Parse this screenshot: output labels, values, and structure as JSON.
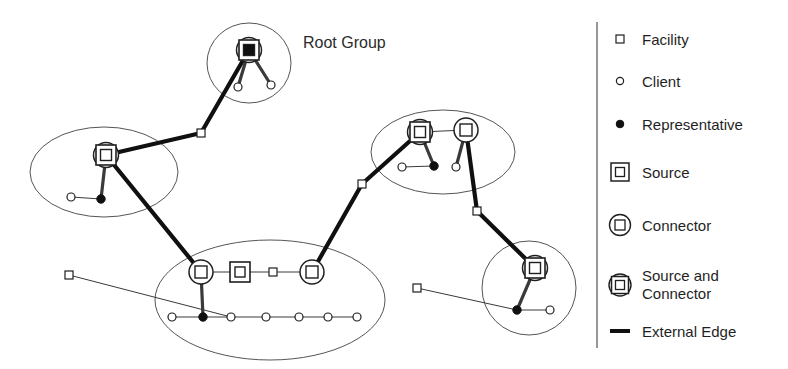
{
  "canvas": {
    "width": 788,
    "height": 369,
    "background": "#ffffff"
  },
  "colors": {
    "ink": "#1f1f1f",
    "group_outline": "#555555",
    "internal_edge": "#3a3a3a",
    "external_edge": "#101010",
    "node_fill": "#ffffff",
    "representative_fill": "#101010",
    "divider": "#6b6b6b"
  },
  "diagram": {
    "annotations": [
      {
        "id": "root-group-label",
        "text": "Root Group",
        "x": 303,
        "y": 48
      }
    ],
    "groups": [
      {
        "id": "group-root",
        "shape": "ellipse",
        "cx": 249,
        "cy": 63,
        "rx": 42,
        "ry": 40
      },
      {
        "id": "group-left",
        "shape": "ellipse",
        "cx": 104,
        "cy": 172,
        "rx": 74,
        "ry": 45
      },
      {
        "id": "group-right",
        "shape": "ellipse",
        "cx": 443,
        "cy": 152,
        "rx": 72,
        "ry": 42
      },
      {
        "id": "group-bottom",
        "shape": "ellipse",
        "cx": 270,
        "cy": 300,
        "rx": 115,
        "ry": 60
      },
      {
        "id": "group-bottom-right",
        "shape": "ellipse",
        "cx": 529,
        "cy": 288,
        "rx": 47,
        "ry": 47
      }
    ],
    "nodes": [
      {
        "id": "n-root-sc",
        "type": "source-and-connector",
        "x": 249,
        "y": 50,
        "group": "group-root"
      },
      {
        "id": "n-root-c1",
        "type": "client",
        "x": 238,
        "y": 87,
        "group": "group-root"
      },
      {
        "id": "n-root-c2",
        "type": "client",
        "x": 271,
        "y": 85,
        "group": "group-root"
      },
      {
        "id": "n-left-sc",
        "type": "source-and-connector",
        "x": 106,
        "y": 155,
        "group": "group-left"
      },
      {
        "id": "n-left-rep",
        "type": "representative",
        "x": 101,
        "y": 199,
        "group": "group-left"
      },
      {
        "id": "n-left-c1",
        "type": "client",
        "x": 71,
        "y": 197,
        "group": "group-left"
      },
      {
        "id": "n-right-sc",
        "type": "source-and-connector",
        "x": 420,
        "y": 132,
        "group": "group-right"
      },
      {
        "id": "n-right-co",
        "type": "connector",
        "x": 466,
        "y": 130,
        "group": "group-right"
      },
      {
        "id": "n-right-rep",
        "type": "representative",
        "x": 434,
        "y": 166,
        "group": "group-right"
      },
      {
        "id": "n-right-c1",
        "type": "client",
        "x": 402,
        "y": 167,
        "group": "group-right"
      },
      {
        "id": "n-right-c2",
        "type": "client",
        "x": 456,
        "y": 167,
        "group": "group-right"
      },
      {
        "id": "n-bot-co1",
        "type": "connector",
        "x": 201,
        "y": 272,
        "group": "group-bottom"
      },
      {
        "id": "n-bot-src",
        "type": "source",
        "x": 240,
        "y": 272,
        "group": "group-bottom"
      },
      {
        "id": "n-bot-fac",
        "type": "facility",
        "x": 273,
        "y": 272,
        "group": "group-bottom"
      },
      {
        "id": "n-bot-co2",
        "type": "connector",
        "x": 312,
        "y": 272,
        "group": "group-bottom"
      },
      {
        "id": "n-bot-rep",
        "type": "representative",
        "x": 203,
        "y": 317,
        "group": "group-bottom"
      },
      {
        "id": "n-bot-c1",
        "type": "client",
        "x": 172,
        "y": 317,
        "group": "group-bottom"
      },
      {
        "id": "n-bot-c2",
        "type": "client",
        "x": 231,
        "y": 317,
        "group": "group-bottom"
      },
      {
        "id": "n-bot-c3",
        "type": "client",
        "x": 266,
        "y": 317,
        "group": "group-bottom"
      },
      {
        "id": "n-bot-c4",
        "type": "client",
        "x": 299,
        "y": 317,
        "group": "group-bottom"
      },
      {
        "id": "n-bot-c5",
        "type": "client",
        "x": 328,
        "y": 317,
        "group": "group-bottom"
      },
      {
        "id": "n-bot-c6",
        "type": "client",
        "x": 357,
        "y": 317,
        "group": "group-bottom"
      },
      {
        "id": "n-br-sc",
        "type": "source-and-connector",
        "x": 535,
        "y": 268,
        "group": "group-bottom-right"
      },
      {
        "id": "n-br-rep",
        "type": "representative",
        "x": 517,
        "y": 310,
        "group": "group-bottom-right"
      },
      {
        "id": "n-br-c1",
        "type": "client",
        "x": 550,
        "y": 310,
        "group": "group-bottom-right"
      },
      {
        "id": "n-fac-a",
        "type": "facility",
        "x": 201,
        "y": 133,
        "group": null
      },
      {
        "id": "n-fac-b",
        "type": "facility",
        "x": 362,
        "y": 184,
        "group": null
      },
      {
        "id": "n-fac-c",
        "type": "facility",
        "x": 477,
        "y": 211,
        "group": null
      },
      {
        "id": "n-fac-d",
        "type": "facility",
        "x": 69,
        "y": 275,
        "group": null
      },
      {
        "id": "n-fac-e",
        "type": "facility",
        "x": 417,
        "y": 288,
        "group": null
      }
    ],
    "edges": [
      {
        "from": "n-root-sc",
        "to": "n-root-c1",
        "kind": "internal"
      },
      {
        "from": "n-root-sc",
        "to": "n-root-c2",
        "kind": "internal"
      },
      {
        "from": "n-left-sc",
        "to": "n-left-rep",
        "kind": "internal"
      },
      {
        "from": "n-left-rep",
        "to": "n-left-c1",
        "kind": "thin"
      },
      {
        "from": "n-right-sc",
        "to": "n-right-co",
        "kind": "thin"
      },
      {
        "from": "n-right-sc",
        "to": "n-right-rep",
        "kind": "internal"
      },
      {
        "from": "n-right-rep",
        "to": "n-right-c1",
        "kind": "thin"
      },
      {
        "from": "n-right-co",
        "to": "n-right-c2",
        "kind": "internal"
      },
      {
        "from": "n-bot-co1",
        "to": "n-bot-src",
        "kind": "thin"
      },
      {
        "from": "n-bot-src",
        "to": "n-bot-fac",
        "kind": "thin"
      },
      {
        "from": "n-bot-fac",
        "to": "n-bot-co2",
        "kind": "thin"
      },
      {
        "from": "n-bot-co1",
        "to": "n-bot-rep",
        "kind": "internal"
      },
      {
        "from": "n-bot-rep",
        "to": "n-bot-c1",
        "kind": "thin"
      },
      {
        "from": "n-bot-rep",
        "to": "n-bot-c2",
        "kind": "thin"
      },
      {
        "from": "n-bot-c2",
        "to": "n-bot-c3",
        "kind": "thin"
      },
      {
        "from": "n-bot-c3",
        "to": "n-bot-c4",
        "kind": "thin"
      },
      {
        "from": "n-bot-c4",
        "to": "n-bot-c5",
        "kind": "thin"
      },
      {
        "from": "n-bot-c5",
        "to": "n-bot-c6",
        "kind": "thin"
      },
      {
        "from": "n-br-sc",
        "to": "n-br-rep",
        "kind": "internal"
      },
      {
        "from": "n-br-rep",
        "to": "n-br-c1",
        "kind": "thin"
      },
      {
        "from": "n-root-sc",
        "to": "n-fac-a",
        "kind": "external"
      },
      {
        "from": "n-fac-a",
        "to": "n-left-sc",
        "kind": "external"
      },
      {
        "from": "n-left-sc",
        "to": "n-bot-co1",
        "kind": "external"
      },
      {
        "from": "n-bot-co2",
        "to": "n-fac-b",
        "kind": "external"
      },
      {
        "from": "n-fac-b",
        "to": "n-right-sc",
        "kind": "external"
      },
      {
        "from": "n-right-co",
        "to": "n-fac-c",
        "kind": "external"
      },
      {
        "from": "n-fac-c",
        "to": "n-br-sc",
        "kind": "external"
      },
      {
        "from": "n-fac-d",
        "to": "n-bot-c2",
        "kind": "thin"
      },
      {
        "from": "n-fac-e",
        "to": "n-br-rep",
        "kind": "thin"
      }
    ]
  },
  "legend": {
    "divider_x": 597,
    "items": [
      {
        "id": "legend-facility",
        "icon": "facility-icon",
        "label": "Facility",
        "y": 39
      },
      {
        "id": "legend-client",
        "icon": "client-icon",
        "label": "Client",
        "y": 81
      },
      {
        "id": "legend-rep",
        "icon": "representative-icon",
        "label": "Representative",
        "y": 124
      },
      {
        "id": "legend-source",
        "icon": "source-icon",
        "label": "Source",
        "y": 172
      },
      {
        "id": "legend-connector",
        "icon": "connector-icon",
        "label": "Connector",
        "y": 225
      },
      {
        "id": "legend-source-con",
        "icon": "source-and-connector-icon",
        "label": "Source and Connector",
        "label_line1": "Source and",
        "label_line2": "Connector",
        "y": 285
      },
      {
        "id": "legend-ext-edge",
        "icon": "external-edge-icon",
        "label": "External Edge",
        "y": 331
      }
    ]
  }
}
